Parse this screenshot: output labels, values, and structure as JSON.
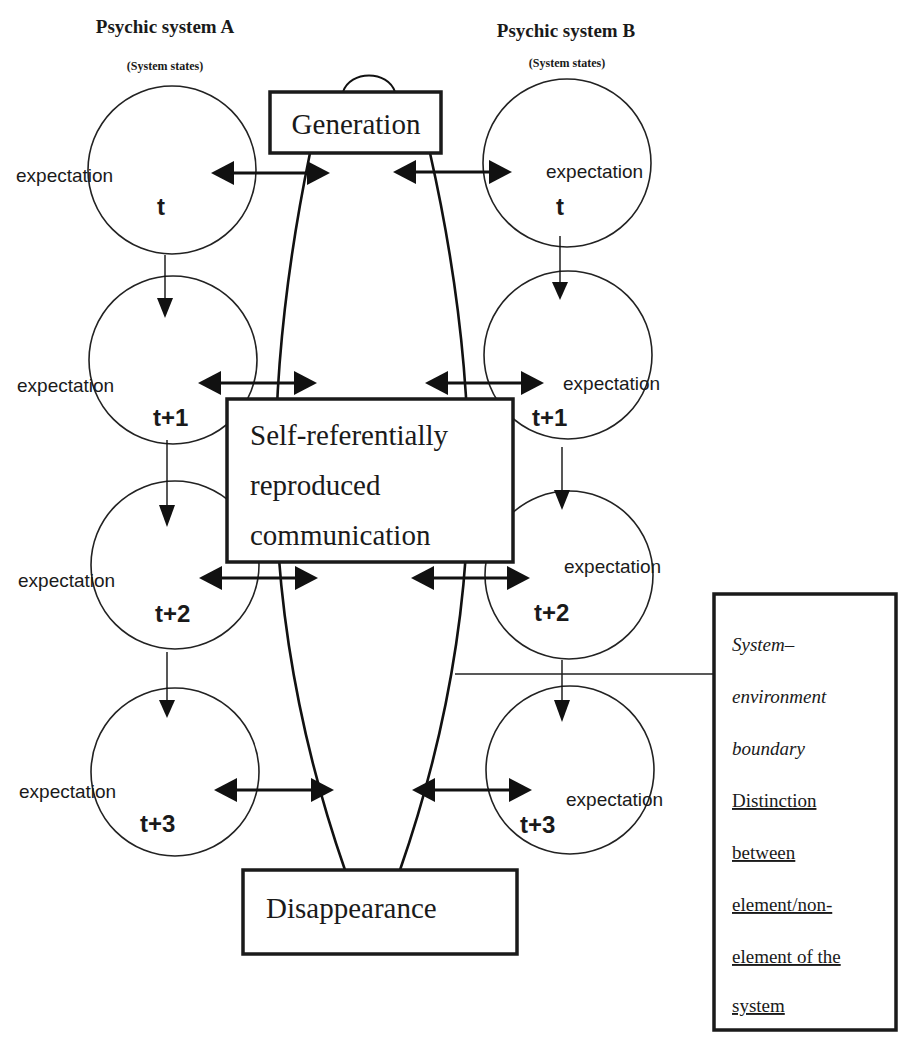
{
  "diagram": {
    "systems": [
      {
        "id": "A",
        "title": "Psychic system A",
        "subtitle": "(System states)",
        "states": [
          {
            "expectation_label": "expectation",
            "time_label": "t"
          },
          {
            "expectation_label": "expectation",
            "time_label": "t+1"
          },
          {
            "expectation_label": "expectation",
            "time_label": "t+2"
          },
          {
            "expectation_label": "expectation",
            "time_label": "t+3"
          }
        ]
      },
      {
        "id": "B",
        "title": "Psychic system B",
        "subtitle": "(System states)",
        "states": [
          {
            "expectation_label": "expectation",
            "time_label": "t"
          },
          {
            "expectation_label": "expectation",
            "time_label": "t+1"
          },
          {
            "expectation_label": "expectation",
            "time_label": "t+2"
          },
          {
            "expectation_label": "expectation",
            "time_label": "t+3"
          }
        ]
      }
    ],
    "communication": {
      "generation_label": "Generation",
      "core_lines": [
        "Self-referentially",
        "reproduced",
        "communication"
      ],
      "disappearance_label": "Disappearance"
    },
    "boundary_note": {
      "italic_lines": [
        "System–",
        "environment",
        "boundary"
      ],
      "underlined_lines": [
        "Distinction",
        "between",
        "element/non-",
        "element of the",
        "system"
      ]
    },
    "colors": {
      "ink": "#1a1a1a",
      "background": "#ffffff"
    }
  }
}
